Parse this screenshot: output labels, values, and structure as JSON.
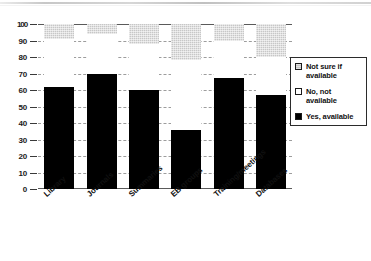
{
  "chart_data": {
    "type": "bar",
    "stacked": true,
    "title": "",
    "subtitle": "",
    "xlabel": "",
    "ylabel": "",
    "ylim": [
      0,
      100
    ],
    "yticks": [
      0,
      10,
      20,
      30,
      40,
      50,
      60,
      70,
      80,
      90,
      100
    ],
    "ytick_labels": [
      "0",
      "10",
      "20",
      "30",
      "40",
      "50",
      "60",
      "70",
      "80",
      "90",
      "100"
    ],
    "grid": true,
    "grid_axis": "y",
    "legend_position": "right",
    "categories": [
      "Library",
      "Journals",
      "Summaries",
      "EB groups",
      "Training/meetings",
      "Databases"
    ],
    "series": [
      {
        "name": "Yes, available",
        "color": "#000000",
        "values": [
          62,
          70,
          60,
          36,
          67,
          57
        ]
      },
      {
        "name": "No, not available",
        "color": "#ffffff",
        "values": [
          29,
          24,
          28,
          42,
          23,
          23
        ]
      },
      {
        "name": "Not sure if available",
        "color": "#c7c7c7",
        "values": [
          9,
          6,
          12,
          22,
          10,
          20
        ]
      }
    ]
  },
  "legend": {
    "items": [
      {
        "label_line1": "Not sure if",
        "label_line2": "available",
        "swatch": "notsure"
      },
      {
        "label_line1": "No, not",
        "label_line2": "available",
        "swatch": "no"
      },
      {
        "label_line1": "Yes, available",
        "label_line2": "",
        "swatch": "yes"
      }
    ]
  }
}
